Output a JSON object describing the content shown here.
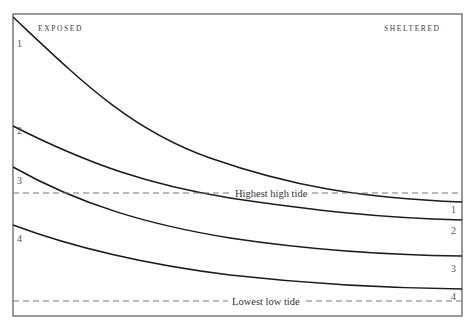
{
  "diagram": {
    "frame": {
      "left": 13,
      "top": 14,
      "right": 462,
      "bottom": 316,
      "stroke": "#555555"
    },
    "labels": {
      "left_header": "EXPOSED",
      "right_header": "SHELTERED",
      "highest_tide": "Highest high tide",
      "lowest_tide": "Lowest low tide"
    },
    "tide_lines": {
      "highest_y": 193,
      "lowest_y": 301,
      "color": "#777777"
    },
    "zones": [
      {
        "id": "1",
        "left_label": "1",
        "right_label": "1",
        "left_y": 17,
        "mid_y": 154,
        "right_y": 202
      },
      {
        "id": "2",
        "left_label": "2",
        "right_label": "2",
        "left_y": 126,
        "mid_y": 180,
        "right_y": 220
      },
      {
        "id": "3",
        "left_label": "3",
        "right_label": "3",
        "left_y": 167,
        "mid_y": 234,
        "right_y": 256
      },
      {
        "id": "4",
        "left_label": "4",
        "right_label": "4",
        "left_y": 225,
        "mid_y": 270,
        "right_y": 289
      }
    ],
    "curve_color": "#1a1a1a"
  }
}
